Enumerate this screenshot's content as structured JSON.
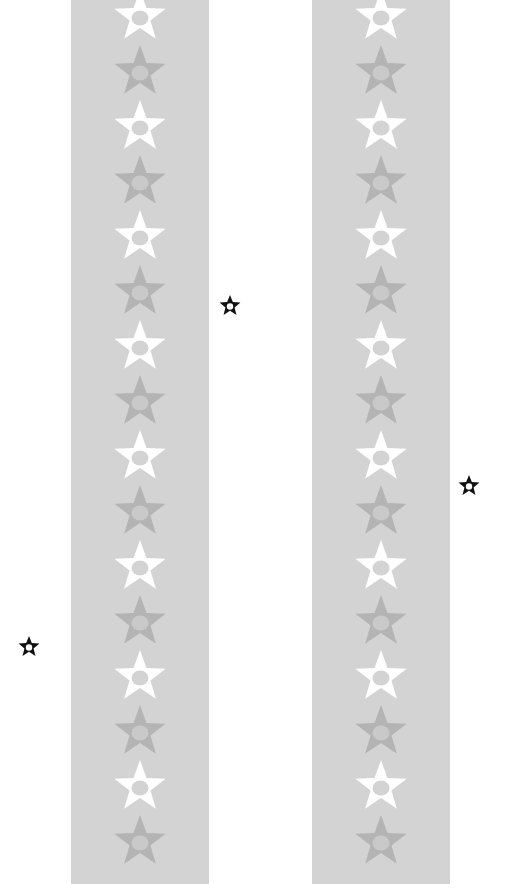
{
  "canvas": {
    "width": 515,
    "height": 889,
    "background": "#ffffff"
  },
  "colors": {
    "banner": "#d3d3d3",
    "star_light_fill": "#ffffff",
    "star_light_center": "#d3d3d3",
    "star_dark_fill": "#b4b4b4",
    "star_dark_center": "#c9c9c9",
    "marker_stroke": "#111111",
    "marker_fill": "#ffffff"
  },
  "banners": [
    {
      "id": "left",
      "x": 71,
      "width": 138,
      "height": 884,
      "star_count": 16,
      "first_star_y": 16,
      "star_spacing": 55,
      "pattern": [
        "light",
        "dark"
      ]
    },
    {
      "id": "right",
      "x": 312,
      "width": 138,
      "height": 884,
      "star_count": 16,
      "first_star_y": 16,
      "star_spacing": 55,
      "pattern": [
        "light",
        "dark"
      ]
    }
  ],
  "markers": [
    {
      "id": "marker-1",
      "icon": "star-outline-icon",
      "cx": 230,
      "cy": 305
    },
    {
      "id": "marker-2",
      "icon": "star-outline-icon",
      "cx": 469,
      "cy": 485
    },
    {
      "id": "marker-3",
      "icon": "star-outline-icon",
      "cx": 29,
      "cy": 646
    }
  ]
}
